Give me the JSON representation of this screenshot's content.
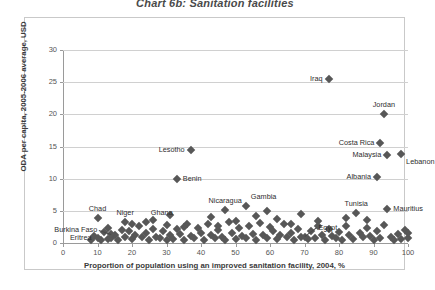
{
  "title": "Chart 6b: Sanitation facilities",
  "chart_data": {
    "type": "scatter",
    "title": "Chart 6b: Sanitation facilities",
    "xlabel": "Proportion of population using an improved sanitation facility, 2004, %",
    "ylabel": "ODA per capita, 2005-2006 average, USD",
    "xlim": [
      0,
      100
    ],
    "ylim": [
      0,
      30
    ],
    "xticks": [
      0,
      10,
      20,
      30,
      40,
      50,
      60,
      70,
      80,
      90,
      100
    ],
    "yticks": [
      0,
      5,
      10,
      15,
      20,
      25,
      30
    ],
    "grid": "horizontal",
    "legend": "none",
    "marker": "diamond",
    "marker_color": "#575757",
    "labeled_points": [
      {
        "name": "Iraq",
        "x": 77,
        "y": 25.5,
        "label_pos": "left"
      },
      {
        "name": "Jordan",
        "x": 93,
        "y": 20.0,
        "label_pos": "above"
      },
      {
        "name": "Costa Rica",
        "x": 92,
        "y": 15.6,
        "label_pos": "left"
      },
      {
        "name": "Malaysia",
        "x": 94,
        "y": 13.7,
        "label_pos": "left"
      },
      {
        "name": "Lebanon",
        "x": 98,
        "y": 13.8,
        "label_pos": "below-right"
      },
      {
        "name": "Albania",
        "x": 91,
        "y": 10.2,
        "label_pos": "left"
      },
      {
        "name": "Lesotho",
        "x": 37,
        "y": 14.5,
        "label_pos": "left"
      },
      {
        "name": "Benin",
        "x": 33,
        "y": 10.0,
        "label_pos": "right"
      },
      {
        "name": "Nicaragua",
        "x": 47,
        "y": 5.2,
        "label_pos": "above"
      },
      {
        "name": "Gambia",
        "x": 53,
        "y": 5.8,
        "label_pos": "above-right"
      },
      {
        "name": "Tunisia",
        "x": 85,
        "y": 4.6,
        "label_pos": "above"
      },
      {
        "name": "Mauritius",
        "x": 94,
        "y": 5.3,
        "label_pos": "right"
      },
      {
        "name": "Chad",
        "x": 10,
        "y": 3.9,
        "label_pos": "above"
      },
      {
        "name": "Niger",
        "x": 18,
        "y": 3.2,
        "label_pos": "above"
      },
      {
        "name": "Ghana",
        "x": 24,
        "y": 3.2,
        "label_pos": "above-right"
      },
      {
        "name": "Burkina Faso",
        "x": 14,
        "y": 1.4,
        "label_pos": "left-leader"
      },
      {
        "name": "Eritrea",
        "x": 10,
        "y": 0.7,
        "label_pos": "left"
      },
      {
        "name": "Egypt",
        "x": 70,
        "y": 0.9,
        "label_pos": "right-leader"
      }
    ],
    "points": [
      {
        "x": 8,
        "y": 0.5
      },
      {
        "x": 9,
        "y": 1.1
      },
      {
        "x": 11,
        "y": 0.4
      },
      {
        "x": 12,
        "y": 1.7
      },
      {
        "x": 13,
        "y": 0.6
      },
      {
        "x": 13,
        "y": 2.3
      },
      {
        "x": 14,
        "y": 0.8
      },
      {
        "x": 15,
        "y": 1.3
      },
      {
        "x": 16,
        "y": 0.5
      },
      {
        "x": 17,
        "y": 2.0
      },
      {
        "x": 18,
        "y": 1.0
      },
      {
        "x": 19,
        "y": 1.8
      },
      {
        "x": 20,
        "y": 0.6
      },
      {
        "x": 21,
        "y": 1.2
      },
      {
        "x": 22,
        "y": 2.6
      },
      {
        "x": 23,
        "y": 0.9
      },
      {
        "x": 24,
        "y": 1.5
      },
      {
        "x": 25,
        "y": 0.5
      },
      {
        "x": 26,
        "y": 2.1
      },
      {
        "x": 27,
        "y": 1.0
      },
      {
        "x": 28,
        "y": 0.7
      },
      {
        "x": 29,
        "y": 1.9
      },
      {
        "x": 30,
        "y": 0.4
      },
      {
        "x": 30,
        "y": 2.8
      },
      {
        "x": 31,
        "y": 1.2
      },
      {
        "x": 32,
        "y": 0.6
      },
      {
        "x": 33,
        "y": 2.2
      },
      {
        "x": 34,
        "y": 1.4
      },
      {
        "x": 35,
        "y": 0.5
      },
      {
        "x": 36,
        "y": 3.0
      },
      {
        "x": 37,
        "y": 1.1
      },
      {
        "x": 38,
        "y": 0.8
      },
      {
        "x": 39,
        "y": 2.4
      },
      {
        "x": 40,
        "y": 1.6
      },
      {
        "x": 41,
        "y": 0.5
      },
      {
        "x": 42,
        "y": 2.9
      },
      {
        "x": 43,
        "y": 1.3
      },
      {
        "x": 44,
        "y": 0.7
      },
      {
        "x": 45,
        "y": 2.0
      },
      {
        "x": 46,
        "y": 1.0
      },
      {
        "x": 47,
        "y": 0.5
      },
      {
        "x": 48,
        "y": 3.3
      },
      {
        "x": 49,
        "y": 1.5
      },
      {
        "x": 50,
        "y": 0.6
      },
      {
        "x": 51,
        "y": 2.3
      },
      {
        "x": 52,
        "y": 1.1
      },
      {
        "x": 53,
        "y": 0.8
      },
      {
        "x": 54,
        "y": 2.7
      },
      {
        "x": 55,
        "y": 1.4
      },
      {
        "x": 56,
        "y": 0.5
      },
      {
        "x": 57,
        "y": 3.1
      },
      {
        "x": 58,
        "y": 1.2
      },
      {
        "x": 59,
        "y": 0.7
      },
      {
        "x": 60,
        "y": 2.5
      },
      {
        "x": 61,
        "y": 1.8
      },
      {
        "x": 62,
        "y": 0.6
      },
      {
        "x": 63,
        "y": 1.3
      },
      {
        "x": 64,
        "y": 2.9
      },
      {
        "x": 65,
        "y": 0.9
      },
      {
        "x": 66,
        "y": 1.6
      },
      {
        "x": 67,
        "y": 0.5
      },
      {
        "x": 68,
        "y": 2.2
      },
      {
        "x": 69,
        "y": 1.0
      },
      {
        "x": 71,
        "y": 0.6
      },
      {
        "x": 72,
        "y": 1.9
      },
      {
        "x": 73,
        "y": 0.8
      },
      {
        "x": 74,
        "y": 3.4
      },
      {
        "x": 75,
        "y": 1.3
      },
      {
        "x": 76,
        "y": 0.5
      },
      {
        "x": 77,
        "y": 2.1
      },
      {
        "x": 78,
        "y": 1.1
      },
      {
        "x": 79,
        "y": 0.7
      },
      {
        "x": 80,
        "y": 1.7
      },
      {
        "x": 81,
        "y": 0.5
      },
      {
        "x": 82,
        "y": 2.6
      },
      {
        "x": 83,
        "y": 1.2
      },
      {
        "x": 84,
        "y": 0.6
      },
      {
        "x": 86,
        "y": 1.5
      },
      {
        "x": 87,
        "y": 0.9
      },
      {
        "x": 88,
        "y": 2.3
      },
      {
        "x": 89,
        "y": 1.1
      },
      {
        "x": 90,
        "y": 0.5
      },
      {
        "x": 91,
        "y": 1.8
      },
      {
        "x": 92,
        "y": 0.7
      },
      {
        "x": 93,
        "y": 2.8
      },
      {
        "x": 95,
        "y": 1.0
      },
      {
        "x": 96,
        "y": 0.5
      },
      {
        "x": 97,
        "y": 1.4
      },
      {
        "x": 98,
        "y": 0.6
      },
      {
        "x": 99,
        "y": 2.0
      },
      {
        "x": 100,
        "y": 0.8
      },
      {
        "x": 100,
        "y": 1.6
      },
      {
        "x": 31,
        "y": 4.4
      },
      {
        "x": 43,
        "y": 4.0
      },
      {
        "x": 56,
        "y": 4.2
      },
      {
        "x": 62,
        "y": 3.7
      },
      {
        "x": 69,
        "y": 4.5
      },
      {
        "x": 82,
        "y": 3.9
      },
      {
        "x": 88,
        "y": 3.6
      },
      {
        "x": 26,
        "y": 3.5
      },
      {
        "x": 20,
        "y": 3.0
      },
      {
        "x": 50,
        "y": 3.4
      },
      {
        "x": 59,
        "y": 5.0
      },
      {
        "x": 74,
        "y": 2.6
      },
      {
        "x": 35,
        "y": 2.5
      },
      {
        "x": 45,
        "y": 2.6
      },
      {
        "x": 66,
        "y": 3.0
      }
    ]
  }
}
